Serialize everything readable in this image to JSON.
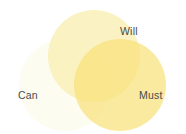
{
  "figure": {
    "title": "",
    "background_color": "#ffffff",
    "label_color": "#4a4a4a"
  },
  "chart_data": {
    "type": "venn",
    "title": "",
    "xlabel": "",
    "ylabel": "",
    "sets": [
      {
        "id": "will",
        "label": "Will",
        "color": "#faf3c0",
        "cx": 94,
        "cy": 56,
        "r": 46,
        "label_x": 120,
        "label_y": 26
      },
      {
        "id": "can",
        "label": "Can",
        "color": "#fdfcf0",
        "cx": 65,
        "cy": 85,
        "r": 46,
        "label_x": 18,
        "label_y": 90
      },
      {
        "id": "must",
        "label": "Must",
        "color": "#faea9a",
        "cx": 120,
        "cy": 85,
        "r": 46,
        "label_x": 139,
        "label_y": 90
      }
    ],
    "intersections": [
      {
        "sets": [
          "can",
          "will"
        ],
        "color": "#faf2c8"
      },
      {
        "sets": [
          "will",
          "must"
        ],
        "color": "#f7dc7a"
      },
      {
        "sets": [
          "can",
          "must"
        ],
        "color": "#fcf5cd"
      },
      {
        "sets": [
          "can",
          "will",
          "must"
        ],
        "color": "#f9ca3f"
      }
    ],
    "legend_position": "inline-labels",
    "grid": false
  }
}
